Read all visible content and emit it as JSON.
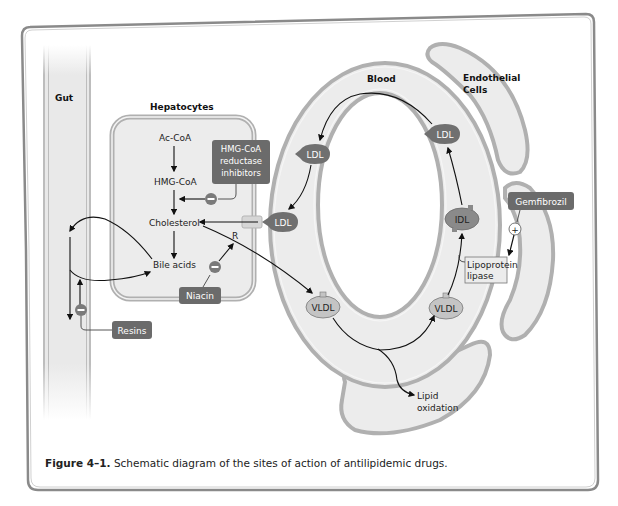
{
  "figure": {
    "caption_label": "Figure 4–1.",
    "caption_text": " Schematic diagram of the sites of action of antilipidemic drugs."
  },
  "regions": {
    "gut": "Gut",
    "hepatocytes": "Hepatocytes",
    "blood": "Blood",
    "endothelial_line1": "Endothelial",
    "endothelial_line2": "Cells"
  },
  "metabolites": {
    "ac_coa": "Ac-CoA",
    "hmg_coa": "HMG-CoA",
    "cholesterol": "Cholesterol",
    "bile_acids": "Bile acids",
    "receptor": "R",
    "lipid_oxidation_line1": "Lipid",
    "lipid_oxidation_line2": "oxidation",
    "lipoprotein_lipase_line1": "Lipoprotein",
    "lipoprotein_lipase_line2": "lipase"
  },
  "lipoproteins": {
    "ldl_receptor": "LDL",
    "ldl_left": "LDL",
    "ldl_right": "LDL",
    "idl": "IDL",
    "vldl_left": "VLDL",
    "vldl_right": "VLDL"
  },
  "drugs": {
    "statin_line1": "HMG-CoA",
    "statin_line2": "reductase",
    "statin_line3": "inhibitors",
    "niacin": "Niacin",
    "resins": "Resins",
    "gemfibrozil": "Gemfibrozil"
  },
  "symbols": {
    "inhibit": "−",
    "stimulate": "+"
  },
  "colors": {
    "drug_box": "#6b6b6b",
    "lipoprotein_dark": "#707070",
    "lipoprotein_light": "#bdbdbd",
    "membrane_fill": "#ececec",
    "membrane_stroke": "#b0b0b0",
    "frame": "#8a8a8a"
  }
}
